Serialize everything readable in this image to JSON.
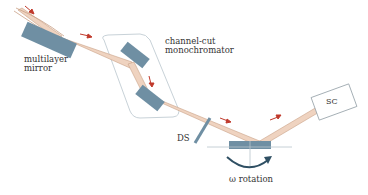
{
  "diagram": {
    "type": "x-ray reflectometer beam path schematic",
    "labels": {
      "multilayer_line1": "multilayer",
      "multilayer_line2": "mirror",
      "channel_cut_line1": "channel-cut",
      "channel_cut_line2": "monochromator",
      "ds": "DS",
      "sc": "SC",
      "omega": "ω rotation"
    },
    "colors": {
      "beam_fill": "#efd3c0",
      "beam_edge": "#c9a186",
      "optic": "#6f8fa3",
      "arrow": "#c0392b",
      "mono_outline": "#c8d2d8",
      "rotation_arrow": "#2f4f63",
      "sc_box_border": "#9aa5ab",
      "axis_line": "#b8c4cb"
    },
    "components": [
      {
        "id": "multilayer-mirror",
        "label": "multilayer mirror"
      },
      {
        "id": "channel-cut-monochromator",
        "label": "channel-cut monochromator"
      },
      {
        "id": "divergence-slit",
        "label": "DS"
      },
      {
        "id": "sample",
        "label": "sample stage"
      },
      {
        "id": "scintillation-counter",
        "label": "SC"
      }
    ]
  }
}
